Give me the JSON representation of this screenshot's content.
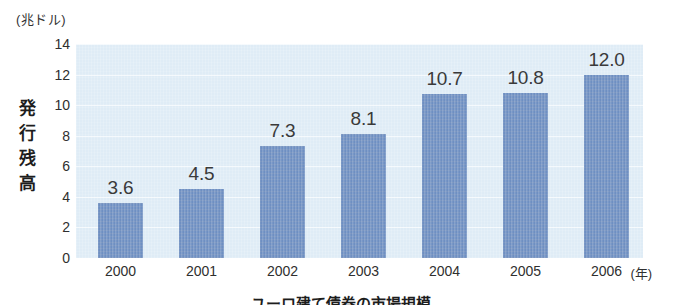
{
  "figure": {
    "unit_label": "(兆ドル)",
    "y_axis_title_chars": [
      "発",
      "行",
      "残",
      "高"
    ],
    "x_unit_label": "(年)",
    "caption": "ユーロ建て債券の市場規模"
  },
  "colors": {
    "bar": "#6e8fc2",
    "plot_background": "#dfecf6",
    "gridline": "#f4fafd",
    "text": "#2b2b2b",
    "page_background": "#ffffff"
  },
  "chart_data": {
    "type": "bar",
    "title": "",
    "subtitle": "",
    "xlabel": "(年)",
    "ylabel": "発行残高",
    "unit": "兆ドル",
    "categories": [
      "2000",
      "2001",
      "2002",
      "2003",
      "2004",
      "2005",
      "2006"
    ],
    "values": [
      3.6,
      4.5,
      7.3,
      8.1,
      10.7,
      10.8,
      12.0
    ],
    "value_labels": [
      "3.6",
      "4.5",
      "7.3",
      "8.1",
      "10.7",
      "10.8",
      "12.0"
    ],
    "ylim": [
      0,
      14
    ],
    "yticks": [
      0,
      2,
      4,
      6,
      8,
      10,
      12,
      14
    ],
    "ytick_labels": [
      "0",
      "2",
      "4",
      "6",
      "8",
      "10",
      "12",
      "14"
    ],
    "grid": true,
    "grid_axis": "y",
    "legend": false,
    "legend_position": "none",
    "series": [
      {
        "name": "発行残高",
        "values": [
          3.6,
          4.5,
          7.3,
          8.1,
          10.7,
          10.8,
          12.0
        ]
      }
    ]
  }
}
